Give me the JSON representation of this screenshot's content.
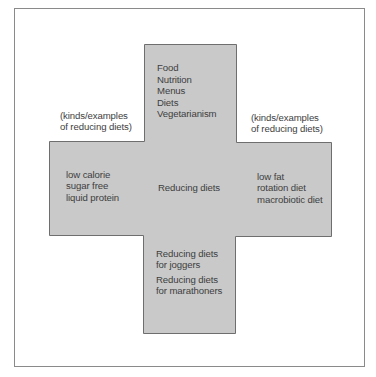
{
  "diagram": {
    "type": "cross-concept-map",
    "colors": {
      "cross_fill": "#c9c9c9",
      "cross_stroke": "#6e6e6e",
      "frame_stroke": "#8a8a8a",
      "text": "#3e3e3e",
      "background": "#ffffff"
    },
    "center": {
      "label": "Reducing diets"
    },
    "top": {
      "items": [
        "Food",
        "Nutrition",
        "Menus",
        "Diets",
        "Vegetarianism"
      ]
    },
    "left_annotation": {
      "line1": "(kinds/examples",
      "line2": "of reducing diets)"
    },
    "right_annotation": {
      "line1": "(kinds/examples",
      "line2": "of reducing diets)"
    },
    "left": {
      "items": [
        "low calorie",
        "sugar free",
        "liquid protein"
      ]
    },
    "right": {
      "items": [
        "low fat",
        "rotation diet",
        "macrobiotic diet"
      ]
    },
    "bottom": {
      "groups": [
        {
          "line1": "Reducing diets",
          "line2": "for joggers"
        },
        {
          "line1": "Reducing diets",
          "line2": "for marathoners"
        }
      ]
    }
  }
}
